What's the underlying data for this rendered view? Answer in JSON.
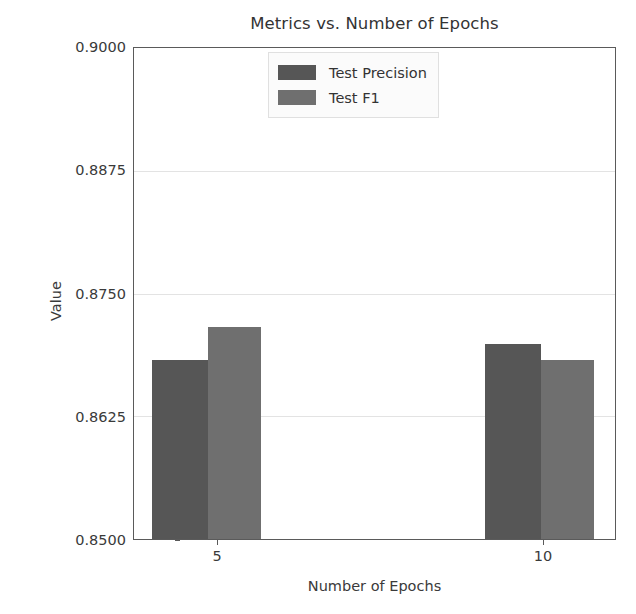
{
  "chart_data": {
    "type": "bar",
    "title": "Metrics vs. Number of Epochs",
    "xlabel": "Number of Epochs",
    "ylabel": "Value",
    "categories": [
      "5",
      "10"
    ],
    "series": [
      {
        "name": "Test Precision",
        "color": "#565656",
        "values": [
          0.8682,
          0.8699
        ]
      },
      {
        "name": "Test F1",
        "color": "#6f6f6f",
        "values": [
          0.8716,
          0.8682
        ]
      }
    ],
    "ylim": [
      0.85,
      0.9
    ],
    "yticks": [
      "0.8500",
      "0.8625",
      "0.8750",
      "0.8875",
      "0.9000"
    ],
    "ytick_values": [
      0.85,
      0.8625,
      0.875,
      0.8875,
      0.9
    ],
    "grid": true,
    "grid_axis": "y",
    "legend_position": "upper center"
  },
  "legend": {
    "entries": [
      {
        "label": "Test Precision"
      },
      {
        "label": "Test F1"
      }
    ]
  }
}
